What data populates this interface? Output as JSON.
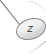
{
  "widget": {
    "name": "z-axis-gizmo",
    "type": "3d-viewport-axis-indicator",
    "background_color": "#ffffff"
  },
  "axis": {
    "label": "Z",
    "line": {
      "name": "z-axis-line",
      "start": {
        "x": 0,
        "y": 0
      },
      "end": {
        "x": 23,
        "y": 29
      },
      "color": "#787878",
      "width": 1.1
    },
    "cap": {
      "name": "z-axis-cap",
      "shape": "ellipse",
      "center": {
        "x": 31,
        "y": 29
      },
      "radius_x": 15,
      "radius_y": 10,
      "rotation_deg": -18,
      "outline_color": "#8a8a8a",
      "fill_top_color": "#f2f2f2",
      "fill_mid_color": "#e0e0e0",
      "fill_bottom_color": "#cfcfcf"
    },
    "label_position": {
      "x": 30,
      "y": 32
    },
    "label_color": "#2b2b2b"
  },
  "edges": {
    "bottom_right_edge_color": "#d8d8d8",
    "top_right_arc_color": "#dcdcdc"
  }
}
